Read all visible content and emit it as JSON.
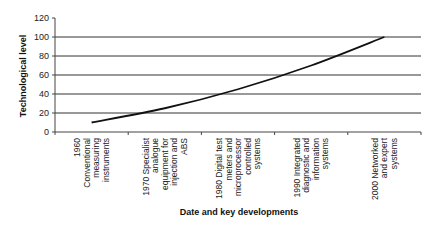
{
  "chart_data": {
    "type": "line",
    "title": "",
    "xlabel": "Date and key developments",
    "ylabel": "Technological level",
    "ylim": [
      0,
      120
    ],
    "yticks": [
      0,
      20,
      40,
      60,
      80,
      100,
      120
    ],
    "grid": true,
    "legend": null,
    "categories": [
      [
        "1960",
        "Conventional",
        "measuring",
        "instruments"
      ],
      [
        "1970 Specialist",
        "analogue",
        "equipment for",
        "injection and",
        "ABS"
      ],
      [
        "1980 Digital test",
        "meters and",
        "microprocessor",
        "controlled",
        "systems"
      ],
      [
        "1990 Integrated",
        "diagnostic and",
        "information",
        "systems"
      ],
      [
        "2000 Networked",
        "and expert",
        "systems"
      ]
    ],
    "series": [
      {
        "name": "Technological level",
        "values": [
          10,
          25,
          45,
          70,
          102
        ]
      }
    ],
    "colors": {
      "line": "#111111",
      "grid": "#333333",
      "axis": "#444444"
    }
  }
}
